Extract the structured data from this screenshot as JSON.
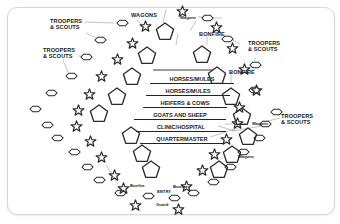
{
  "diagram": {
    "center_labels": [
      "HORSES/MULES",
      "HORSES/MULES",
      "HEIFERS & COWS",
      "GOATS AND SHEEP",
      "CLINIC/HOSPITAL",
      "QUARTERMASTER"
    ],
    "outer_labels": {
      "wagons_top": "WAGONS",
      "wagons_top_right": "Wagons",
      "bonfire_top": "BONFIRE",
      "bonfire_right": "BONFIRE",
      "troopers_top_left": "TROOPERS & SCOUTS",
      "troopers_left": "TROOPERS & SCOUTS",
      "troopers_top_right": "TROOPERS & SCOUTS",
      "troopers_right": "TROOPERS & SCOUTS",
      "wagons_right_1": "Wagons",
      "wagons_right_2": "Wagons",
      "bonfire_bottom_left": "Bonfire",
      "bonfire_bottom_right": "Bonfire",
      "entry": "ENTRY",
      "guard": "Guard"
    },
    "legend_shapes": {
      "star": "sentry / bonfire post",
      "pentagon": "tent",
      "hexagon": "trooper / scout post"
    },
    "colors": {
      "stroke": "#2a2a2a",
      "leader_line": "#9a9a9a",
      "background": "#ffffff",
      "frame_border": "#d6d6d6"
    }
  }
}
